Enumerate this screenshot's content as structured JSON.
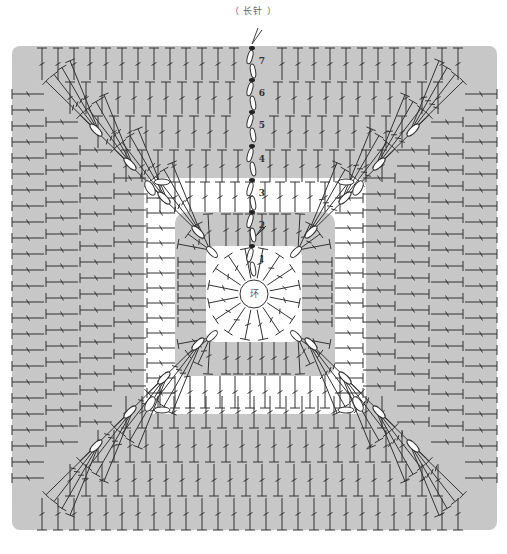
{
  "legend": {
    "stitch_label": "（ 长针 ）"
  },
  "center": {
    "ring_label": "环"
  },
  "rounds": [
    {
      "number": "1",
      "fill": "#ffffff"
    },
    {
      "number": "2",
      "fill": "#c8c8c8"
    },
    {
      "number": "3",
      "fill": "#ffffff"
    },
    {
      "number": "4",
      "fill": "#c8c8c8"
    },
    {
      "number": "5",
      "fill": "#c8c8c8"
    },
    {
      "number": "6",
      "fill": "#c8c8c8"
    },
    {
      "number": "7",
      "fill": "#c8c8c8"
    }
  ],
  "icons": {
    "start": "scissors-start-icon",
    "stitch": "treble-crochet-icon",
    "chain": "chain-stitch-icon",
    "slip": "slip-stitch-icon"
  },
  "colors": {
    "gray_fill": "#c8c8c8",
    "white_fill": "#ffffff",
    "stroke": "#333333"
  }
}
